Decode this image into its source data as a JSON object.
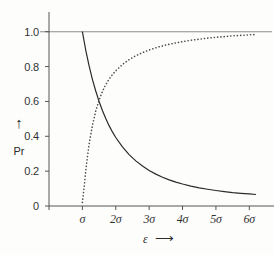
{
  "chart_data": {
    "type": "line",
    "title": "",
    "subtitle": "",
    "xlabel": "ε",
    "ylabel": "Pr",
    "xlabel_arrow": "⟶",
    "ylabel_arrow": "↑",
    "grid": false,
    "legend": null,
    "legend_position": "none",
    "xlim": [
      0,
      6.5
    ],
    "ylim": [
      0,
      1.05
    ],
    "x_tick_labels": [
      "σ",
      "2σ",
      "3σ",
      "4σ",
      "5σ",
      "6σ"
    ],
    "x_tick_values": [
      1,
      2,
      3,
      4,
      5,
      6
    ],
    "y_tick_labels": [
      "0",
      "0.2",
      "0.4",
      "0.6",
      "0.8",
      "1.0"
    ],
    "y_tick_values": [
      0,
      0.2,
      0.4,
      0.6,
      0.8,
      1.0
    ],
    "reference_lines": [
      {
        "name": "unity-line",
        "orientation": "horizontal",
        "value": 1.0,
        "style": "solid",
        "color": "#8c8c8c"
      }
    ],
    "series": [
      {
        "name": "decaying-probability",
        "style": "solid",
        "color": "#2b2b2b",
        "x": [
          1.0,
          1.1,
          1.2,
          1.3,
          1.4,
          1.5,
          1.6,
          1.7,
          1.8,
          1.9,
          2.0,
          2.2,
          2.4,
          2.6,
          2.8,
          3.0,
          3.2,
          3.4,
          3.6,
          3.8,
          4.0,
          4.25,
          4.5,
          4.75,
          5.0,
          5.25,
          5.5,
          5.75,
          6.0,
          6.2
        ],
        "y": [
          1.0,
          0.895,
          0.805,
          0.727,
          0.66,
          0.6,
          0.548,
          0.502,
          0.461,
          0.425,
          0.393,
          0.339,
          0.295,
          0.259,
          0.229,
          0.204,
          0.183,
          0.165,
          0.15,
          0.137,
          0.126,
          0.114,
          0.104,
          0.096,
          0.089,
          0.083,
          0.077,
          0.073,
          0.069,
          0.066
        ]
      },
      {
        "name": "rising-probability",
        "style": "dotted",
        "color": "#4a4a4a",
        "x": [
          1.0,
          1.05,
          1.1,
          1.15,
          1.2,
          1.3,
          1.4,
          1.5,
          1.6,
          1.7,
          1.8,
          1.9,
          2.0,
          2.2,
          2.4,
          2.6,
          2.8,
          3.0,
          3.25,
          3.5,
          3.75,
          4.0,
          4.25,
          4.5,
          4.75,
          5.0,
          5.25,
          5.5,
          5.75,
          6.0,
          6.2
        ],
        "y": [
          0.02,
          0.105,
          0.2,
          0.282,
          0.352,
          0.463,
          0.545,
          0.608,
          0.657,
          0.696,
          0.728,
          0.754,
          0.776,
          0.812,
          0.84,
          0.862,
          0.88,
          0.895,
          0.911,
          0.924,
          0.934,
          0.943,
          0.951,
          0.957,
          0.963,
          0.968,
          0.972,
          0.976,
          0.979,
          0.982,
          0.984
        ]
      }
    ]
  },
  "axes": {
    "y_axis_title": "Pr",
    "x_axis_title": "ε"
  }
}
